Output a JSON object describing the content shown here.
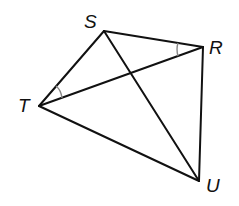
{
  "diagram": {
    "type": "quadrilateral-with-diagonals",
    "vertices": {
      "S": {
        "label": "S",
        "x": 104,
        "y": 31
      },
      "R": {
        "label": "R",
        "x": 203,
        "y": 47
      },
      "T": {
        "label": "T",
        "x": 39,
        "y": 106
      },
      "U": {
        "label": "U",
        "x": 199,
        "y": 181
      }
    },
    "segments": [
      "ST",
      "SR",
      "RU",
      "TU",
      "TR",
      "SU"
    ],
    "angle_marks": [
      {
        "vertex": "T",
        "between": [
          "S",
          "R"
        ],
        "color": "#888888"
      },
      {
        "vertex": "R",
        "between": [
          "S",
          "T"
        ],
        "color": "#888888"
      }
    ],
    "line_color": "#111111"
  }
}
